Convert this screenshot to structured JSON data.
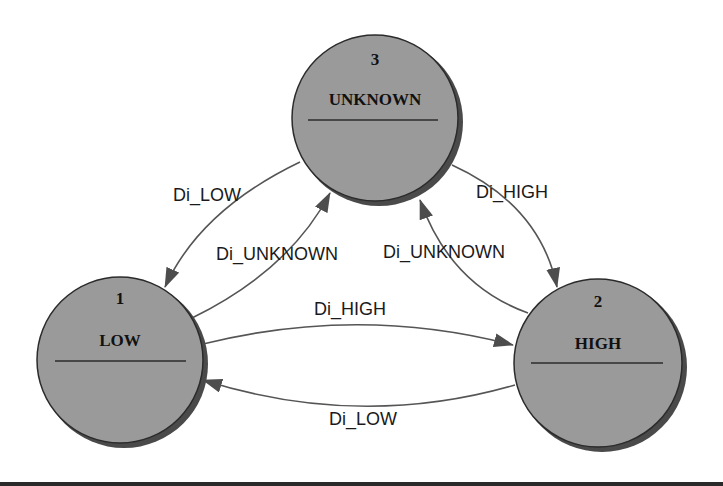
{
  "diagram": {
    "type": "state-machine",
    "colors": {
      "state_fill": "#9a9a9a",
      "state_shadow": "#4a4a4a",
      "state_stroke": "#2b2b2b",
      "edge": "#555555",
      "arrowhead": "#4d4d4d",
      "text": "#111111",
      "background": "#ffffff"
    },
    "states": [
      {
        "id": "1",
        "number": "1",
        "name": "LOW",
        "cx": 120,
        "cy": 360,
        "r": 84
      },
      {
        "id": "2",
        "number": "2",
        "name": "HIGH",
        "cx": 598,
        "cy": 363,
        "r": 85
      },
      {
        "id": "3",
        "number": "3",
        "name": "UNKNOWN",
        "cx": 375,
        "cy": 118,
        "r": 84
      }
    ],
    "transitions": [
      {
        "from": "3",
        "to": "1",
        "label": "Di_LOW"
      },
      {
        "from": "1",
        "to": "3",
        "label": "Di_UNKNOWN"
      },
      {
        "from": "3",
        "to": "2",
        "label": "Di_HIGH"
      },
      {
        "from": "2",
        "to": "3",
        "label": "Di_UNKNOWN"
      },
      {
        "from": "1",
        "to": "2",
        "label": "Di_HIGH"
      },
      {
        "from": "2",
        "to": "1",
        "label": "Di_LOW"
      }
    ]
  }
}
